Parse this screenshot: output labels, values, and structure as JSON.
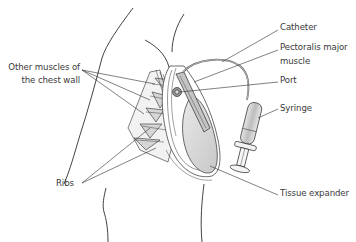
{
  "figure": {
    "labels": {
      "other_muscles_line1": "Other muscles of",
      "other_muscles_line2": "the chest wall",
      "ribs": "Ribs",
      "catheter": "Catheter",
      "pectoralis_line1": "Pectoralis major",
      "pectoralis_line2": "muscle",
      "port": "Port",
      "syringe": "Syringe",
      "tissue_expander": "Tissue expander"
    },
    "colors": {
      "line": "#2e2e2e",
      "label_text": "#3a3a3a",
      "expander_fill": "#d4d4d4",
      "muscle_fill": "#bcbcbc",
      "background": "#ffffff"
    }
  }
}
